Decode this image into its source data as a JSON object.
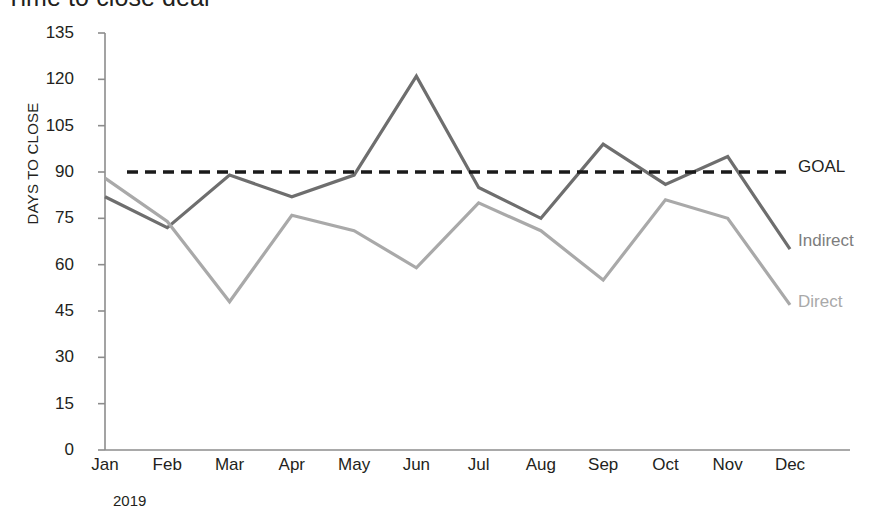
{
  "title": "Time to close deal",
  "axis": {
    "y_title": "DAYS TO CLOSE",
    "period_label": "2019"
  },
  "legend": {
    "goal": "GOAL",
    "indirect": "Indirect",
    "direct": "Direct"
  },
  "colors": {
    "goal": "#1a1a1a",
    "indirect": "#6e6e6e",
    "direct": "#a9a9a9",
    "axis": "#8c8c8c",
    "text": "#231f20",
    "background": "#ffffff"
  },
  "chart_data": {
    "type": "line",
    "title": "Time to close deal",
    "xlabel": "2019",
    "ylabel": "DAYS TO CLOSE",
    "ylim": [
      0,
      135
    ],
    "yticks": [
      0,
      15,
      30,
      45,
      60,
      75,
      90,
      105,
      120,
      135
    ],
    "grid": false,
    "legend_position": "right-end-of-line",
    "categories": [
      "Jan",
      "Feb",
      "Mar",
      "Apr",
      "May",
      "Jun",
      "Jul",
      "Aug",
      "Sep",
      "Oct",
      "Nov",
      "Dec"
    ],
    "series": [
      {
        "name": "Indirect",
        "color": "#6e6e6e",
        "style": "solid",
        "values": [
          82,
          72,
          89,
          82,
          89,
          121,
          85,
          75,
          99,
          86,
          95,
          65
        ]
      },
      {
        "name": "Direct",
        "color": "#a9a9a9",
        "style": "solid",
        "values": [
          88,
          74,
          48,
          76,
          71,
          59,
          80,
          71,
          55,
          81,
          75,
          47
        ]
      },
      {
        "name": "GOAL",
        "color": "#1a1a1a",
        "style": "dashed",
        "values": [
          90,
          90,
          90,
          90,
          90,
          90,
          90,
          90,
          90,
          90,
          90,
          90
        ]
      }
    ]
  }
}
